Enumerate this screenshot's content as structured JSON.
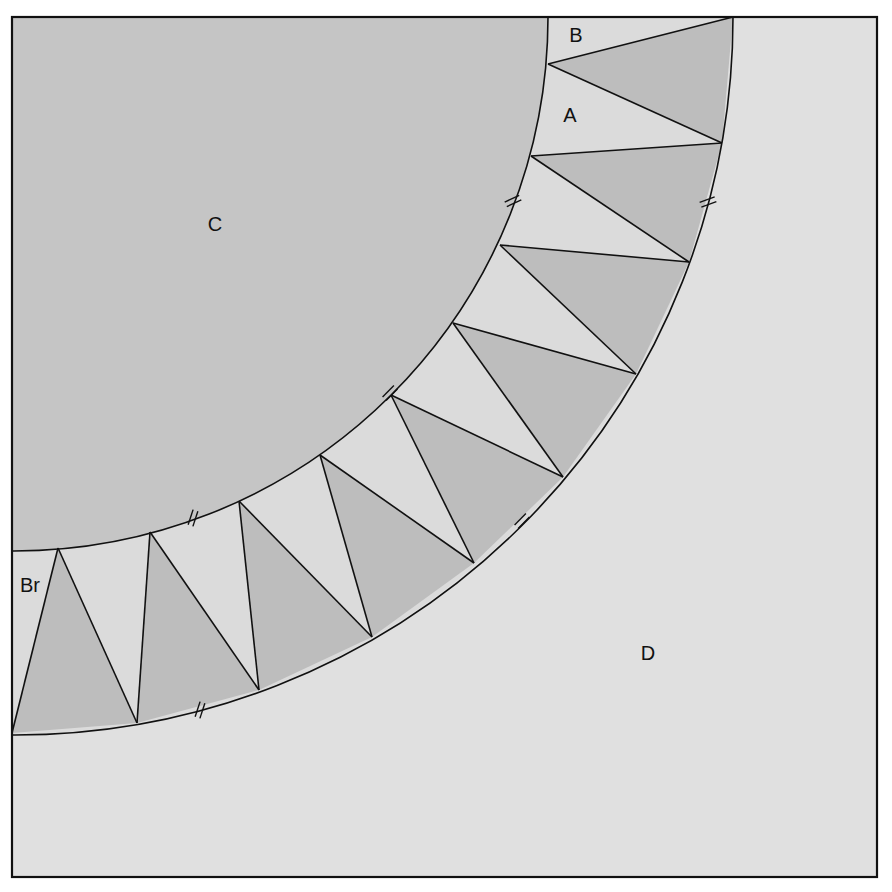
{
  "colors": {
    "background": "#ffffff",
    "region_c": "#c5c5c5",
    "region_d": "#e0e0e0",
    "band_light": "#dbdbdb",
    "triangle_dark": "#bdbdbd",
    "stroke": "#111111"
  },
  "frame": {
    "x": 12,
    "y": 17,
    "width": 865,
    "height": 860
  },
  "arc": {
    "cx": 12,
    "cy": 17,
    "r_inner": 534,
    "r_outer": 718
  },
  "inner_points": [
    [
      548,
      17
    ],
    [
      548,
      64
    ],
    [
      531,
      156
    ],
    [
      500,
      245
    ],
    [
      453,
      323
    ],
    [
      391,
      395
    ],
    [
      320,
      455
    ],
    [
      239,
      501
    ],
    [
      150,
      532
    ],
    [
      58,
      548
    ],
    [
      12,
      550
    ]
  ],
  "outer_points": [
    [
      733,
      17
    ],
    [
      722,
      143
    ],
    [
      689,
      262
    ],
    [
      636,
      374
    ],
    [
      563,
      477
    ],
    [
      474,
      563
    ],
    [
      372,
      637
    ],
    [
      259,
      690
    ],
    [
      137,
      723
    ],
    [
      12,
      733
    ]
  ],
  "triangles": [
    [
      [
        548,
        64
      ],
      [
        733,
        17
      ],
      [
        722,
        143
      ]
    ],
    [
      [
        531,
        156
      ],
      [
        722,
        143
      ],
      [
        689,
        262
      ]
    ],
    [
      [
        500,
        245
      ],
      [
        689,
        262
      ],
      [
        636,
        374
      ]
    ],
    [
      [
        453,
        323
      ],
      [
        636,
        374
      ],
      [
        563,
        477
      ]
    ],
    [
      [
        391,
        395
      ],
      [
        563,
        477
      ],
      [
        474,
        563
      ]
    ],
    [
      [
        320,
        455
      ],
      [
        474,
        563
      ],
      [
        372,
        637
      ]
    ],
    [
      [
        239,
        501
      ],
      [
        372,
        637
      ],
      [
        259,
        690
      ]
    ],
    [
      [
        150,
        532
      ],
      [
        259,
        690
      ],
      [
        137,
        723
      ]
    ],
    [
      [
        58,
        548
      ],
      [
        137,
        723
      ],
      [
        12,
        733
      ]
    ]
  ],
  "hash_marks": [
    {
      "x": 513,
      "y": 201,
      "angle": -25
    },
    {
      "x": 708,
      "y": 202,
      "angle": -20
    },
    {
      "x": 390,
      "y": 393,
      "angle": -45
    },
    {
      "x": 522,
      "y": 521,
      "angle": -45
    },
    {
      "x": 193,
      "y": 518,
      "angle": -72
    },
    {
      "x": 200,
      "y": 710,
      "angle": -72
    }
  ],
  "labels": [
    {
      "id": "B",
      "text": "B",
      "x": 576,
      "y": 42
    },
    {
      "id": "A",
      "text": "A",
      "x": 570,
      "y": 122
    },
    {
      "id": "C",
      "text": "C",
      "x": 215,
      "y": 231
    },
    {
      "id": "D",
      "text": "D",
      "x": 648,
      "y": 660
    },
    {
      "id": "Br",
      "text": "Br",
      "x": 30,
      "y": 592
    }
  ]
}
